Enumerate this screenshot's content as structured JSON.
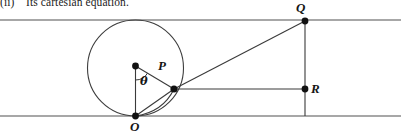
{
  "caption": {
    "number": "(ii)",
    "text": "Its cartesian equation."
  },
  "figure": {
    "type": "geometry-diagram",
    "width": 401,
    "height": 136,
    "colors": {
      "stroke": "#4a4a4a",
      "ink": "#151515",
      "background": "#ffffff",
      "guide_line": "#8a8a8a"
    },
    "guide_lines": [
      {
        "name": "upper-tangent-line",
        "y": 20,
        "x1": 0,
        "x2": 401
      },
      {
        "name": "lower-tangent-line",
        "y": 116,
        "x1": 0,
        "x2": 401
      }
    ],
    "circle": {
      "cx": 135.5,
      "cy": 68,
      "r": 48
    },
    "points": [
      {
        "id": "O",
        "label": "O",
        "x": 135.5,
        "y": 116,
        "label_x": 131,
        "label_y": 121
      },
      {
        "id": "C",
        "label": "",
        "x": 135.5,
        "y": 66,
        "label_x": 0,
        "label_y": 0
      },
      {
        "id": "P",
        "label": "P",
        "x": 174,
        "y": 89,
        "label_x": 158,
        "label_y": 60
      },
      {
        "id": "Q",
        "label": "Q",
        "x": 305,
        "y": 21,
        "label_x": 297,
        "label_y": 2
      },
      {
        "id": "R",
        "label": "R",
        "x": 305,
        "y": 89,
        "label_x": 311,
        "label_y": 83
      }
    ],
    "segments": [
      {
        "name": "center-to-O",
        "x1": 135.5,
        "y1": 66,
        "x2": 135.5,
        "y2": 116
      },
      {
        "name": "center-to-P",
        "x1": 135.5,
        "y1": 66,
        "x2": 174,
        "y2": 89
      },
      {
        "name": "O-to-P",
        "x1": 135.5,
        "y1": 116,
        "x2": 174,
        "y2": 89
      },
      {
        "name": "P-to-Q",
        "x1": 174,
        "y1": 89,
        "x2": 305,
        "y2": 21
      },
      {
        "name": "P-to-R",
        "x1": 174,
        "y1": 89,
        "x2": 305,
        "y2": 89
      },
      {
        "name": "Q-to-R-vertical",
        "x1": 305,
        "y1": 21,
        "x2": 305,
        "y2": 116
      }
    ],
    "arcs": [
      {
        "name": "theta-angle-arc",
        "cx": 135.5,
        "cy": 66,
        "r": 14,
        "from_deg": 90,
        "to_deg": 31
      },
      {
        "name": "rolling-arc-O-to-P",
        "x1": 135.5,
        "y1": 116,
        "x2": 174,
        "y2": 89,
        "bulge": "downward"
      }
    ],
    "angle_label": {
      "symbol": "θ",
      "x": 141,
      "y": 83
    }
  }
}
